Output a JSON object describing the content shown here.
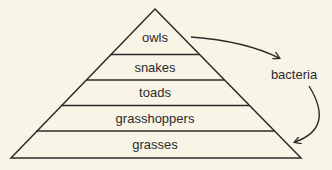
{
  "diagram": {
    "type": "food-pyramid",
    "levels": [
      {
        "label": "owls"
      },
      {
        "label": "snakes"
      },
      {
        "label": "toads"
      },
      {
        "label": "grasshoppers"
      },
      {
        "label": "grasses"
      }
    ],
    "decomposer": {
      "label": "bacteria"
    },
    "arrows": [
      {
        "from": "owls",
        "to": "bacteria"
      },
      {
        "from": "bacteria",
        "to": "grasses"
      }
    ],
    "colors": {
      "background": "#f8f4e6",
      "stroke": "#2b2b2b",
      "text": "#2b2b2b"
    }
  }
}
